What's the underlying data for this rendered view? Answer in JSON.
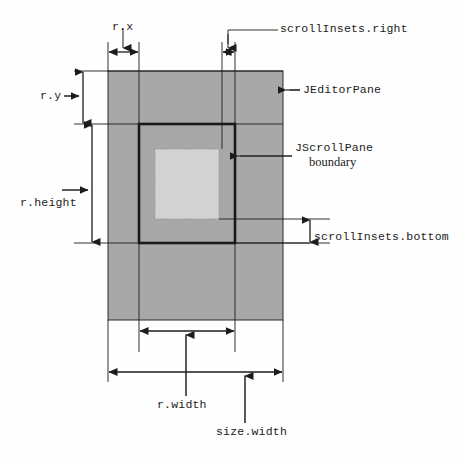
{
  "diagram": {
    "colors": {
      "editor_pane_fill": "#a8a8a8",
      "viewport_fill": "#d2d2d2",
      "line": "#1c1c1c",
      "scrollpane_border": "#181818",
      "viewport_border": "#8a8a8a",
      "background": "#fefefe"
    },
    "shapes": {
      "editor_pane": {
        "x": 108,
        "y": 71,
        "width": 175,
        "height": 249
      },
      "scrollpane_boundary": {
        "x": 139,
        "y": 124,
        "width": 96,
        "height": 119
      },
      "viewport": {
        "x": 155,
        "y": 149,
        "width": 64,
        "height": 70
      }
    },
    "labels": {
      "r_x": "r.x",
      "r_y": "r.y",
      "r_height": "r.height",
      "r_width": "r.width",
      "size_width": "size.width",
      "scroll_insets_right": "scrollInsets.right",
      "scroll_insets_bottom": "scrollInsets.bottom",
      "jeditorpane": "JEditorPane",
      "jscrollpane": "JScrollPane",
      "jscrollpane_boundary": "boundary"
    },
    "dimensions": [
      {
        "name": "r.x",
        "orientation": "horizontal",
        "from": 108,
        "to": 139,
        "at": 52
      },
      {
        "name": "scrollInsets.right",
        "orientation": "horizontal",
        "from": 222,
        "to": 235,
        "at": 52
      },
      {
        "name": "r.y",
        "orientation": "vertical",
        "from": 71,
        "to": 124,
        "at": 83
      },
      {
        "name": "r.height",
        "orientation": "vertical",
        "from": 124,
        "to": 243,
        "at": 92
      },
      {
        "name": "scrollInsets.bottom",
        "orientation": "vertical",
        "from": 219,
        "to": 243,
        "at": 310
      },
      {
        "name": "r.width",
        "orientation": "horizontal",
        "from": 139,
        "to": 235,
        "at": 331
      },
      {
        "name": "size.width",
        "orientation": "horizontal",
        "from": 108,
        "to": 283,
        "at": 372
      }
    ]
  }
}
